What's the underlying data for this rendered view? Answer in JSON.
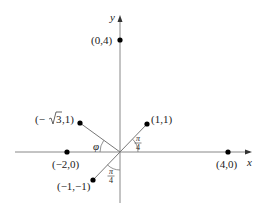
{
  "axes": {
    "x_label": "x",
    "y_label": "y"
  },
  "points": [
    {
      "id": "p04",
      "label": "(0,4)"
    },
    {
      "id": "p40",
      "label": "(4,0)"
    },
    {
      "id": "pm20",
      "label": "(−2,0)"
    },
    {
      "id": "p11",
      "label": "(1,1)"
    },
    {
      "id": "pm31",
      "label_prefix": "(−",
      "label_root": "3",
      "label_suffix": ",1)"
    },
    {
      "id": "pm1m1",
      "label": "(−1,−1)"
    }
  ],
  "angles": {
    "phi": "φ",
    "pi": "π",
    "four": "4"
  }
}
